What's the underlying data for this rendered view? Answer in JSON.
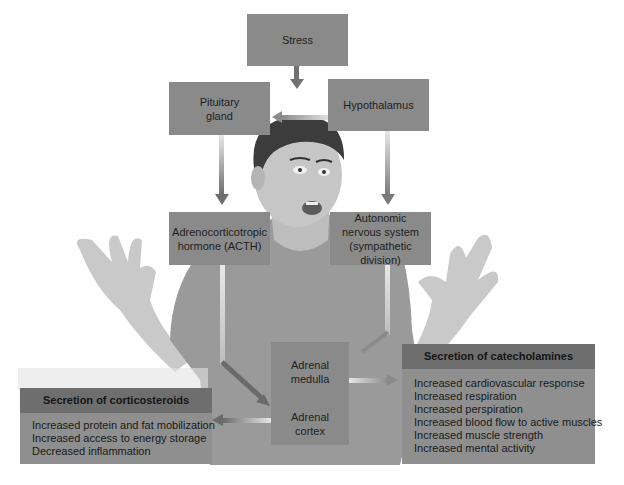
{
  "diagram": {
    "nodes": {
      "stress": "Stress",
      "hypothalamus": "Hypothalamus",
      "pituitary_line1": "Pituitary",
      "pituitary_line2": "gland",
      "acth_line1": "Adrenocorticotropic",
      "acth_line2": "hormone (ACTH)",
      "ans_line1": "Autonomic",
      "ans_line2": "nervous system",
      "ans_line3": "(sympathetic division)",
      "medulla_line1": "Adrenal",
      "medulla_line2": "medulla",
      "cortex_line1": "Adrenal",
      "cortex_line2": "cortex"
    },
    "corticosteroids": {
      "title": "Secretion of corticosteroids",
      "items": [
        "Increased protein and fat mobilization",
        "Increased access to energy storage",
        "Decreased inflammation"
      ]
    },
    "catecholamines": {
      "title": "Secretion of catecholamines",
      "items": [
        "Increased cardiovascular response",
        "Increased respiration",
        "Increased perspiration",
        "Increased blood flow to active muscles",
        "Increased muscle strength",
        "Increased mental activity"
      ]
    },
    "edges": [
      {
        "from": "Stress",
        "to": "Hypothalamus"
      },
      {
        "from": "Hypothalamus",
        "to": "Pituitary gland"
      },
      {
        "from": "Hypothalamus",
        "to": "Autonomic nervous system (sympathetic division)"
      },
      {
        "from": "Pituitary gland",
        "to": "Adrenocorticotropic hormone (ACTH)"
      },
      {
        "from": "Adrenocorticotropic hormone (ACTH)",
        "to": "Adrenal cortex"
      },
      {
        "from": "Autonomic nervous system (sympathetic division)",
        "to": "Adrenal medulla"
      },
      {
        "from": "Adrenal medulla",
        "to": "Secretion of catecholamines"
      },
      {
        "from": "Adrenal cortex",
        "to": "Secretion of corticosteroids"
      }
    ],
    "colors": {
      "box": "#8a8a8a",
      "panel_header": "#6e6e6e",
      "panel_body": "#8f8f8f",
      "arrow": "#6a6a6a"
    }
  }
}
